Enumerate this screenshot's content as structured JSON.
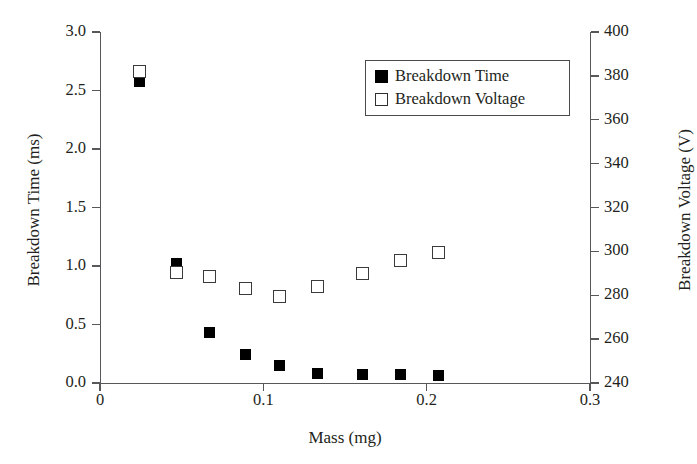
{
  "chart_data": {
    "type": "scatter",
    "title": "",
    "xlabel": "Mass (mg)",
    "ylabel": "Breakdown Time (ms)",
    "ylabel_right": "Breakdown Voltage (V)",
    "xlim": [
      0,
      0.3
    ],
    "xticks": [
      "0",
      "0.1",
      "0.2",
      "0.3"
    ],
    "xtick_values": [
      0,
      0.1,
      0.2,
      0.3
    ],
    "ylim": [
      0.0,
      3.0
    ],
    "yticks": [
      "0.0",
      "0.5",
      "1.0",
      "1.5",
      "2.0",
      "2.5",
      "3.0"
    ],
    "ytick_values": [
      0.0,
      0.5,
      1.0,
      1.5,
      2.0,
      2.5,
      3.0
    ],
    "ylim_right": [
      240,
      400
    ],
    "yticks_right": [
      "240",
      "260",
      "280",
      "300",
      "320",
      "340",
      "360",
      "380",
      "400"
    ],
    "ytick_values_right": [
      240,
      260,
      280,
      300,
      320,
      340,
      360,
      380,
      400
    ],
    "grid": false,
    "legend_position": "top-right",
    "series": [
      {
        "name": "Breakdown Time",
        "marker": "filled-square",
        "color": "#000000",
        "axis": "left",
        "unit": "ms",
        "x": [
          0.024,
          0.047,
          0.067,
          0.089,
          0.11,
          0.133,
          0.161,
          0.184,
          0.207
        ],
        "values": [
          2.58,
          1.02,
          0.43,
          0.24,
          0.15,
          0.08,
          0.07,
          0.07,
          0.06
        ]
      },
      {
        "name": "Breakdown Voltage",
        "marker": "open-square",
        "color": "#3a3a3c",
        "axis": "right",
        "unit": "V",
        "x": [
          0.024,
          0.047,
          0.067,
          0.089,
          0.11,
          0.133,
          0.161,
          0.184,
          0.207
        ],
        "values": [
          382.0,
          290.5,
          288.5,
          283.0,
          279.5,
          284.0,
          290.0,
          296.0,
          299.5
        ],
        "left_axis_equivalent": [
          2.66,
          1.1,
          1.0,
          0.84,
          0.79,
          0.88,
          1.0,
          1.1,
          1.16
        ]
      }
    ]
  },
  "legend": {
    "items": [
      {
        "label": "Breakdown Time",
        "key": "filled"
      },
      {
        "label": "Breakdown Voltage",
        "key": "open"
      }
    ]
  }
}
